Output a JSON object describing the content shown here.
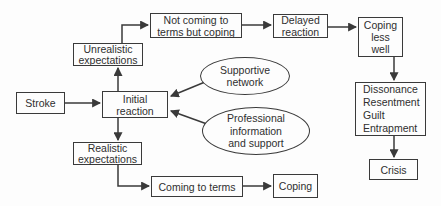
{
  "colors": {
    "line": "#3a3a3a",
    "text": "#2f2f2f",
    "bg": "#fdfdfd"
  },
  "diagram": {
    "nodes": {
      "stroke": {
        "label": "Stroke",
        "shape": "rect"
      },
      "initial": {
        "label": "Initial\nreaction",
        "shape": "rect"
      },
      "unrealistic": {
        "label": "Unrealistic\nexpectations",
        "shape": "rect"
      },
      "not_coming": {
        "label": "Not coming to\nterms but coping",
        "shape": "rect"
      },
      "delayed": {
        "label": "Delayed\nreaction",
        "shape": "rect"
      },
      "coping_less": {
        "label": "Coping\nless\nwell",
        "shape": "rect"
      },
      "dissonance": {
        "label": "Dissonance\nResentment\nGuilt\nEntrapment",
        "shape": "rect"
      },
      "crisis": {
        "label": "Crisis",
        "shape": "rect"
      },
      "realistic": {
        "label": "Realistic\nexpectations",
        "shape": "rect"
      },
      "coming_to_terms": {
        "label": "Coming to terms",
        "shape": "rect"
      },
      "coping": {
        "label": "Coping",
        "shape": "rect"
      },
      "supportive": {
        "label": "Supportive\nnetwork",
        "shape": "ellipse"
      },
      "professional": {
        "label": "Professional\ninformation\nand support",
        "shape": "ellipse"
      }
    },
    "edges": [
      {
        "from": "stroke",
        "to": "initial"
      },
      {
        "from": "initial",
        "to": "unrealistic"
      },
      {
        "from": "unrealistic",
        "to": "not_coming"
      },
      {
        "from": "not_coming",
        "to": "delayed"
      },
      {
        "from": "delayed",
        "to": "coping_less"
      },
      {
        "from": "coping_less",
        "to": "dissonance"
      },
      {
        "from": "dissonance",
        "to": "crisis"
      },
      {
        "from": "initial",
        "to": "realistic"
      },
      {
        "from": "realistic",
        "to": "coming_to_terms"
      },
      {
        "from": "coming_to_terms",
        "to": "coping"
      },
      {
        "from": "supportive",
        "to": "initial"
      },
      {
        "from": "professional",
        "to": "initial"
      }
    ]
  }
}
